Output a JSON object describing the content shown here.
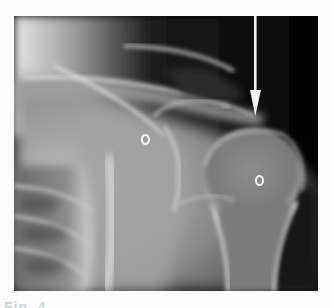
{
  "figure": {
    "type": "radiograph",
    "annotations": {
      "arrow": {
        "color": "#f2f2f2",
        "direction": "down"
      },
      "markers": [
        {
          "label": "O",
          "position": "glenoid / scapula"
        },
        {
          "label": "O",
          "position": "humeral head"
        }
      ]
    },
    "caption_fragment": "Fig. 4"
  },
  "colors": {
    "background": "#fbfbfb",
    "film_dark": "#050505",
    "bone_light": "#d8d8d8"
  }
}
